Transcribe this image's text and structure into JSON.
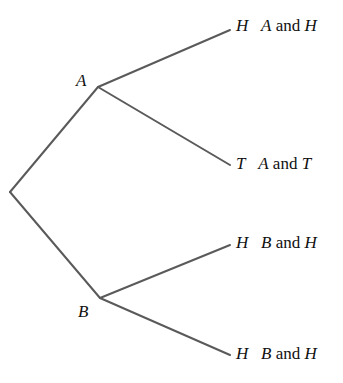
{
  "diagram": {
    "type": "tree",
    "line_color": "#5a5a5a",
    "nodes": {
      "root": {
        "x": 10,
        "y": 192
      },
      "A": {
        "label": "A",
        "x": 98,
        "y": 87
      },
      "B": {
        "label": "B",
        "x": 100,
        "y": 298
      }
    },
    "outcomes": [
      {
        "parent": "A",
        "leaf": "H",
        "result_prefix": "A",
        "result_and": "and",
        "result_suffix": "H",
        "x": 230,
        "y": 30
      },
      {
        "parent": "A",
        "leaf": "T",
        "result_prefix": "A",
        "result_and": "and",
        "result_suffix": "T",
        "x": 230,
        "y": 165
      },
      {
        "parent": "B",
        "leaf": "H",
        "result_prefix": "B",
        "result_and": "and",
        "result_suffix": "H",
        "x": 230,
        "y": 245
      },
      {
        "parent": "B",
        "leaf": "H",
        "result_prefix": "B",
        "result_and": "and",
        "result_suffix": "H",
        "x": 230,
        "y": 355
      }
    ]
  }
}
